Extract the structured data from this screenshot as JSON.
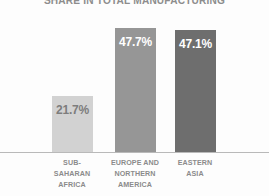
{
  "chart_data": {
    "type": "bar",
    "title": "SHARE IN TOTAL MANUFACTURING",
    "xlabel": "",
    "ylabel": "",
    "ylim": [
      0,
      55
    ],
    "grid": false,
    "legend": "none",
    "categories": [
      "SUB-\nSAHARAN\nAFRICA",
      "EUROPE AND\nNORTHERN\nAMERICA",
      "EASTERN\nASIA"
    ],
    "values": [
      21.7,
      47.7,
      47.1
    ],
    "value_labels": [
      "21.7%",
      "47.7%",
      "47.1%"
    ],
    "bar_colors": [
      "#d2d2d2",
      "#969696",
      "#6e6e6e"
    ],
    "value_label_colors": [
      "#7d7d7d",
      "#ffffff",
      "#ffffff"
    ],
    "title_color": "#8d8d8d",
    "category_label_color": "#8b8b8b",
    "axis_color": "#b9b9b9",
    "background_color": "#fdfdfd"
  }
}
